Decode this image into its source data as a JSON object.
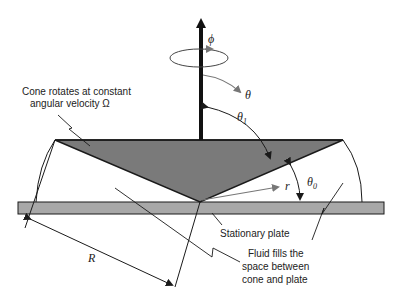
{
  "diagram": {
    "type": "cone-and-plate viscometer schematic",
    "labels": {
      "cone_line1": "Cone rotates at constant",
      "cone_line2": "angular velocity Ω",
      "plate": "Stationary plate",
      "fluid_line1": "Fluid fills the",
      "fluid_line2": "space between",
      "fluid_line3": "cone and plate"
    },
    "symbols": {
      "phi": "ϕ",
      "theta": "θ",
      "theta1": "θ",
      "theta1_sub": "1",
      "theta0": "θ",
      "theta0_sub": "0",
      "r": "r",
      "R": "R"
    },
    "colors": {
      "cone_fill": "#7a7a7a",
      "plate_fill": "#a8a8a8",
      "line": "#1a1a1a",
      "arrow_gray": "#777777",
      "text": "#222222"
    }
  }
}
